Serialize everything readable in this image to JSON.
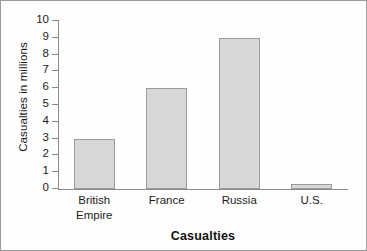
{
  "chart_data": {
    "type": "bar",
    "title": "Casualties",
    "xlabel": "Casualties",
    "ylabel": "Casualties in millions",
    "categories": [
      "British Empire",
      "France",
      "Russia",
      "U.S."
    ],
    "category_lines": [
      [
        "British",
        "Empire"
      ],
      [
        "France"
      ],
      [
        "Russia"
      ],
      [
        "U.S."
      ]
    ],
    "values": [
      3,
      6,
      9,
      0.3
    ],
    "ylim": [
      0,
      10
    ],
    "yticks": [
      10,
      9,
      8,
      7,
      6,
      5,
      4,
      3,
      2,
      1,
      0
    ],
    "ytick_labels": [
      "10",
      "9",
      "8",
      "7",
      "6",
      "5",
      "4",
      "3",
      "2",
      "1",
      "0"
    ],
    "grid": false,
    "legend": null,
    "bar_fill_color": "#d7d7d7",
    "bar_border_color": "#9b9b9b",
    "axis_color": "#8a8a8a",
    "text_color": "#1c1c1c",
    "background_color": "#fefefe",
    "frame_color": "#9a9a9a"
  }
}
